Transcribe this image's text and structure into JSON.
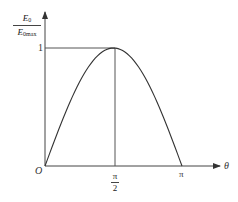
{
  "chart_data": {
    "type": "line",
    "title": "",
    "xlabel": "θ",
    "ylabel": "E0 / E0max",
    "ylabel_parts": {
      "numerator": "E",
      "numerator_sub": "0",
      "denominator": "E",
      "denominator_sub": "0max"
    },
    "x_ticks": [
      {
        "value": 0,
        "label": "O"
      },
      {
        "value": 1.5708,
        "label_num": "π",
        "label_den": "2"
      },
      {
        "value": 3.1416,
        "label": "π"
      }
    ],
    "y_ticks": [
      {
        "value": 1,
        "label": "1"
      }
    ],
    "series": [
      {
        "name": "E0/E0max = sin θ",
        "x": [
          0,
          0.3927,
          0.7854,
          1.1781,
          1.5708,
          1.9635,
          2.3562,
          2.7489,
          3.1416
        ],
        "y": [
          0,
          0.383,
          0.707,
          0.924,
          1.0,
          0.924,
          0.707,
          0.383,
          0
        ]
      }
    ],
    "guides": [
      {
        "type": "horizontal",
        "y": 1,
        "from_x": 0,
        "to_x": 1.5708
      },
      {
        "type": "vertical",
        "x": 1.5708,
        "from_y": 0,
        "to_y": 1
      }
    ],
    "xlim": [
      0,
      3.6
    ],
    "ylim": [
      0,
      1.2
    ],
    "grid": false,
    "legend": "none"
  },
  "labels": {
    "origin": "O",
    "y_one": "1",
    "pi_half_num": "π",
    "pi_half_den": "2",
    "pi": "π",
    "theta": "θ",
    "y_num": "E",
    "y_num_sub": "0",
    "y_den": "E",
    "y_den_sub": "0max"
  },
  "colors": {
    "axis": "#444444",
    "curve": "#333333"
  }
}
